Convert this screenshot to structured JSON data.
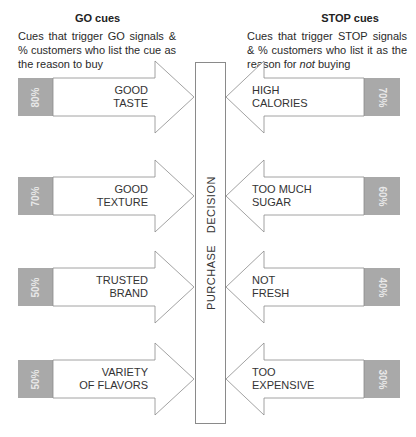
{
  "go": {
    "title": "GO cues",
    "description": "Cues that trigger GO signals & % customers who list the cue as the reason to buy",
    "cues": [
      {
        "line1": "GOOD",
        "line2": "TASTE",
        "percent": "80%"
      },
      {
        "line1": "GOOD",
        "line2": "TEXTURE",
        "percent": "70%"
      },
      {
        "line1": "TRUSTED",
        "line2": "BRAND",
        "percent": "50%"
      },
      {
        "line1": "VARIETY",
        "line2": "OF FLAVORS",
        "percent": "50%"
      }
    ]
  },
  "stop": {
    "title": "STOP cues",
    "description_pre": "Cues that trigger STOP signals & % customers who list it as the reason for ",
    "description_em": "not",
    "description_post": " buying",
    "cues": [
      {
        "line1": "HIGH",
        "line2": "CALORIES",
        "percent": "70%"
      },
      {
        "line1": "TOO MUCH",
        "line2": "SUGAR",
        "percent": "60%"
      },
      {
        "line1": "NOT",
        "line2": "FRESH",
        "percent": "40%"
      },
      {
        "line1": "TOO",
        "line2": "EXPENSIVE",
        "percent": "30%"
      }
    ]
  },
  "center": {
    "label": "PURCHASE DECISION"
  },
  "colors": {
    "box_fill": "#a9a9a9",
    "stroke": "#8a8a8a",
    "arrow_fill": "#ffffff"
  },
  "chart_data": {
    "type": "table",
    "series": [
      {
        "name": "GO cues",
        "categories": [
          "Good taste",
          "Good texture",
          "Trusted brand",
          "Variety of flavors"
        ],
        "values": [
          80,
          70,
          50,
          50
        ]
      },
      {
        "name": "STOP cues",
        "categories": [
          "High calories",
          "Too much sugar",
          "Not fresh",
          "Too expensive"
        ],
        "values": [
          70,
          60,
          40,
          30
        ]
      }
    ],
    "unit": "% customers"
  }
}
